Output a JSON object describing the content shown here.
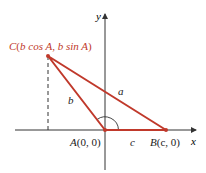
{
  "diagram": {
    "axes": {
      "x_label": "x",
      "y_label": "y"
    },
    "points": {
      "A": {
        "name": "A",
        "label": "(0, 0)"
      },
      "B": {
        "name": "B",
        "label": "(c, 0)"
      },
      "C": {
        "name": "C",
        "label_pre": "(",
        "coord1": "b cos A",
        "sep": ", ",
        "coord2": "b sin A",
        "label_post": ")"
      }
    },
    "sides": {
      "a": "a",
      "b": "b",
      "c": "c"
    },
    "colors": {
      "triangle": "#c0392b",
      "axes": "#333333",
      "dashed": "#333333",
      "angle_arc": "#333333"
    }
  }
}
